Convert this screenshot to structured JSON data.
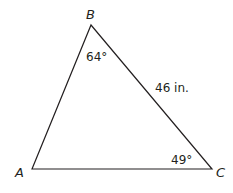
{
  "diagram": {
    "type": "triangle",
    "stroke_color": "#231f20",
    "background": "#ffffff",
    "vertices": {
      "A": {
        "label": "A",
        "x": 32,
        "y": 169
      },
      "B": {
        "label": "B",
        "x": 91,
        "y": 25
      },
      "C": {
        "label": "C",
        "x": 212,
        "y": 169
      }
    },
    "angles": {
      "B": {
        "label": "64°",
        "value": 64
      },
      "C": {
        "label": "49°",
        "value": 49
      }
    },
    "sides": {
      "BC": {
        "label": "46 in.",
        "value": 46,
        "unit": "in."
      }
    }
  }
}
